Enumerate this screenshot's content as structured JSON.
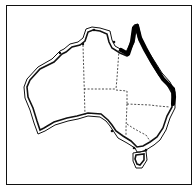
{
  "map": {
    "subject": "Australia outline map",
    "style": "black-and-white line drawing",
    "frame": {
      "border_color": "#111111",
      "background": "#ffffff"
    },
    "coastline": {
      "rendering": "double line",
      "color": "#111111"
    },
    "state_borders": {
      "rendering": "dashed",
      "color": "#222222"
    },
    "highlighted_region": {
      "label": "Queensland east coast (Cape York to QLD/NSW border)",
      "color": "#000000",
      "rendering": "thick solid line"
    },
    "markers": {
      "count": 7,
      "color": "#111111",
      "shape": "dot"
    },
    "regions": [
      "Western Australia",
      "Northern Territory",
      "South Australia",
      "Queensland",
      "New South Wales",
      "Victoria",
      "Tasmania"
    ]
  }
}
